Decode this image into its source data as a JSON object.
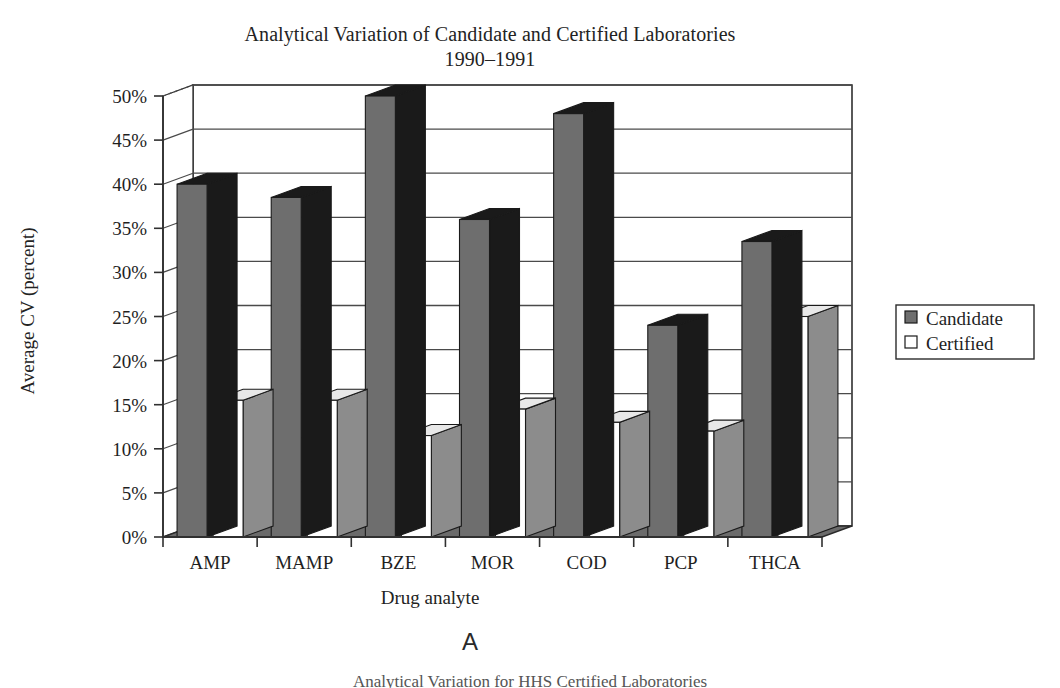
{
  "figure": {
    "panel_label": "A",
    "next_caption": "Analytical Variation for HHS Certified Laboratories"
  },
  "chart": {
    "title_line1": "Analytical Variation of Candidate and Certified Laboratories",
    "title_line2": "1990–1991",
    "y_axis_title": "Average CV (percent)",
    "x_axis_title": "Drug analyte",
    "legend_position": "right",
    "grid": "horizontal",
    "colors": {
      "candidate_face": "#6e6e6e",
      "candidate_side": "#1a1a1a",
      "candidate_top": "#1a1a1a",
      "certified_face": "#ffffff",
      "certified_side": "#8c8c8c",
      "certified_top": "#e8e8e8",
      "floor": "#6b6b6b",
      "axis": "#303030",
      "gridline": "#4a4a4a"
    }
  },
  "chart_data": {
    "type": "bar",
    "title": "Analytical Variation of Candidate and Certified Laboratories 1990–1991",
    "subtitle": "1990–1991",
    "xlabel": "Drug analyte",
    "ylabel": "Average CV (percent)",
    "ylim": [
      0,
      50
    ],
    "ytick_labels": [
      "0%",
      "5%",
      "10%",
      "15%",
      "20%",
      "25%",
      "30%",
      "35%",
      "40%",
      "45%",
      "50%"
    ],
    "ytick_values": [
      0,
      5,
      10,
      15,
      20,
      25,
      30,
      35,
      40,
      45,
      50
    ],
    "categories": [
      "AMP",
      "MAMP",
      "BZE",
      "MOR",
      "COD",
      "PCP",
      "THCA"
    ],
    "series": [
      {
        "name": "Candidate",
        "values": [
          40,
          38.5,
          50,
          36,
          48,
          24,
          33.5
        ]
      },
      {
        "name": "Certified",
        "values": [
          15.5,
          15.5,
          11.5,
          14.5,
          13,
          12,
          25
        ]
      }
    ],
    "legend": [
      "Candidate",
      "Certified"
    ],
    "grid": true,
    "style": "3d-column"
  }
}
